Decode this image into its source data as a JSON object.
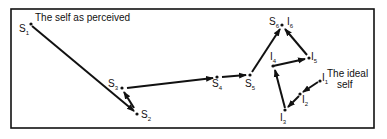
{
  "diagram": {
    "colors": {
      "ink": "#111111",
      "background": "#ffffff"
    },
    "annotations": {
      "perceived": "The self as perceived",
      "ideal_line1": "The ideal",
      "ideal_line2": "self"
    },
    "nodes": [
      {
        "id": "S1",
        "letter": "S",
        "sub": "1"
      },
      {
        "id": "S2",
        "letter": "S",
        "sub": "2"
      },
      {
        "id": "S3",
        "letter": "S",
        "sub": "3"
      },
      {
        "id": "S4",
        "letter": "S",
        "sub": "4"
      },
      {
        "id": "S5",
        "letter": "S",
        "sub": "5"
      },
      {
        "id": "S6",
        "letter": "S",
        "sub": "6"
      },
      {
        "id": "I6",
        "letter": "I",
        "sub": "6"
      },
      {
        "id": "I5",
        "letter": "I",
        "sub": "5"
      },
      {
        "id": "I4",
        "letter": "I",
        "sub": "4"
      },
      {
        "id": "I3",
        "letter": "I",
        "sub": "3"
      },
      {
        "id": "I2",
        "letter": "I",
        "sub": "2"
      },
      {
        "id": "I1",
        "letter": "I",
        "sub": "1"
      }
    ],
    "edges": [
      {
        "from": "S1",
        "to": "S2"
      },
      {
        "from": "S2",
        "to": "S3"
      },
      {
        "from": "S3",
        "to": "S4"
      },
      {
        "from": "S4",
        "to": "S5"
      },
      {
        "from": "S5",
        "to": "S6"
      },
      {
        "from": "I5",
        "to": "I6"
      },
      {
        "from": "I4",
        "to": "I5"
      },
      {
        "from": "I3",
        "to": "I4"
      },
      {
        "from": "I2",
        "to": "I3"
      },
      {
        "from": "I1",
        "to": "I2"
      }
    ]
  }
}
